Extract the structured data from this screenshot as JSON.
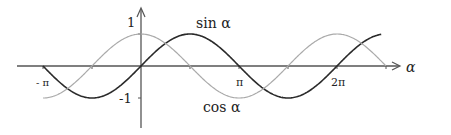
{
  "chart_data": {
    "type": "line",
    "title": "",
    "xlabel": "α",
    "ylabel": "",
    "xlim": [
      -4.2,
      8.2
    ],
    "ylim": [
      -1.6,
      1.6
    ],
    "x_ticks_step": "π/2",
    "x_tick_labels": [
      {
        "value": -3.14159,
        "label": "- π"
      },
      {
        "value": 3.14159,
        "label": "π"
      },
      {
        "value": 6.28318,
        "label": "2π"
      }
    ],
    "y_tick_labels": [
      {
        "value": 1,
        "label": "1"
      },
      {
        "value": -1,
        "label": "-1"
      }
    ],
    "grid": false,
    "series": [
      {
        "name": "sin α",
        "function": "sin",
        "x_range": [
          -3.14159,
          7.7
        ],
        "color": "#2a2a2a"
      },
      {
        "name": "cos α",
        "function": "cos",
        "x_range": [
          -3.14159,
          7.85
        ],
        "color": "#aaaaaa"
      }
    ],
    "annotations": [
      {
        "text": "sin α",
        "near_series": "sin α",
        "position": "top"
      },
      {
        "text": "cos α",
        "near_series": "cos α",
        "position": "bottom"
      }
    ]
  }
}
